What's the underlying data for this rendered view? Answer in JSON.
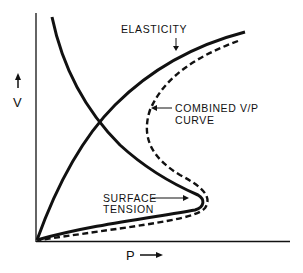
{
  "diagram": {
    "axes": {
      "y_label": "V",
      "x_label": "P",
      "y_arrow": "up-arrow",
      "x_arrow": "right-arrow"
    },
    "curves": [
      {
        "name": "elasticity",
        "style": "solid",
        "label": "ELASTICITY"
      },
      {
        "name": "surface-tension",
        "style": "solid",
        "label_line1": "SURFACE",
        "label_line2": "TENSION"
      },
      {
        "name": "combined",
        "style": "dashed",
        "label_line1": "COMBINED V/P",
        "label_line2": "CURVE"
      }
    ],
    "colors": {
      "line": "#111111",
      "background": "#ffffff"
    }
  }
}
